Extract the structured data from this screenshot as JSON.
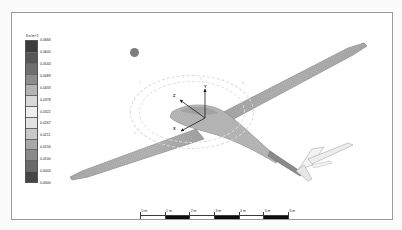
{
  "legend": {
    "title": "Kn/m^2",
    "labels": [
      "0.0666",
      "0.0600",
      "0.0544",
      "0.0489",
      "0.0433",
      "0.0378",
      "0.0322",
      "0.0267",
      "0.0211",
      "0.0156",
      "0.0100",
      "0.0044",
      "0.0000"
    ],
    "tick_values": [
      0.0666,
      0.06,
      0.0544,
      0.0489,
      0.0433,
      0.0378,
      0.0322,
      0.0267,
      0.0211,
      0.0156,
      0.01,
      0.0044,
      0.0
    ],
    "colors": [
      "#3c3c3c",
      "#565656",
      "#6f6f6f",
      "#8d8d8d",
      "#b4b4b4",
      "#d8d8d8",
      "#efefef",
      "#e2e2e2",
      "#c8c8c8",
      "#a8a8a8",
      "#8a8a8a",
      "#6a6a6a",
      "#454545"
    ]
  },
  "scalebar": {
    "labels": [
      "0 m",
      "1 m",
      "2 m",
      "3 m",
      "4 m",
      "5 m",
      "6 m"
    ],
    "tick_positions": [
      0,
      24.6,
      49.3,
      74,
      98.6,
      123.3,
      148
    ],
    "filled_segments": [
      [
        24.6,
        24.7
      ],
      [
        74,
        24.6
      ],
      [
        123.3,
        24.7
      ]
    ]
  },
  "gizmo": {
    "ring_numbers": [
      "1",
      "2",
      "3",
      "4",
      "5",
      "6"
    ]
  },
  "triad": {
    "axes": [
      "Y",
      "Z",
      "X"
    ]
  },
  "model": {
    "name": "glider-mesh"
  },
  "chart_data": {
    "type": "heatmap",
    "title": "Kn/m^2",
    "colorbar_labels": [
      "0.0666",
      "0.0600",
      "0.0544",
      "0.0489",
      "0.0433",
      "0.0378",
      "0.0322",
      "0.0267",
      "0.0211",
      "0.0156",
      "0.0100",
      "0.0044",
      "0.0000"
    ],
    "colorbar_values": [
      0.0666,
      0.06,
      0.0544,
      0.0489,
      0.0433,
      0.0378,
      0.0322,
      0.0267,
      0.0211,
      0.0156,
      0.01,
      0.0044,
      0.0
    ],
    "vmin": 0.0,
    "vmax": 0.0666,
    "units": "Kn/m^2",
    "scale_labels": [
      "0 m",
      "1 m",
      "2 m",
      "3 m",
      "4 m",
      "5 m",
      "6 m"
    ],
    "scale_max_m": 6,
    "legend_position": "left",
    "grid": false
  }
}
